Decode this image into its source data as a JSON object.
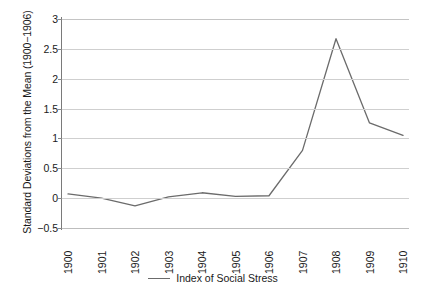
{
  "chart_data": {
    "type": "line",
    "title": "",
    "xlabel": "",
    "ylabel": "Standard Deviations from the Mean (1900−1906)",
    "categories": [
      "1900",
      "1901",
      "1902",
      "1903",
      "1904",
      "1905",
      "1906",
      "1907",
      "1908",
      "1909",
      "1910"
    ],
    "series": [
      {
        "name": "Index of Social Stress",
        "color": "#6b6b6b",
        "values": [
          0.07,
          0.0,
          -0.13,
          0.02,
          0.09,
          0.03,
          0.04,
          0.8,
          2.67,
          1.26,
          1.05
        ]
      }
    ],
    "ylim": [
      -0.5,
      3
    ],
    "yticks": [
      "3",
      "2.5",
      "2",
      "1.5",
      "1",
      "0.5",
      "0",
      "-0.5"
    ],
    "ytick_values": [
      3,
      2.5,
      2,
      1.5,
      1,
      0.5,
      0,
      -0.5
    ],
    "grid": true,
    "legend_position": "bottom"
  },
  "legend": {
    "entries": [
      {
        "label": "Index of Social Stress",
        "color": "#6b6b6b"
      }
    ]
  },
  "axis": {
    "y_title": "Standard Deviations from the Mean (1900−1906)"
  }
}
